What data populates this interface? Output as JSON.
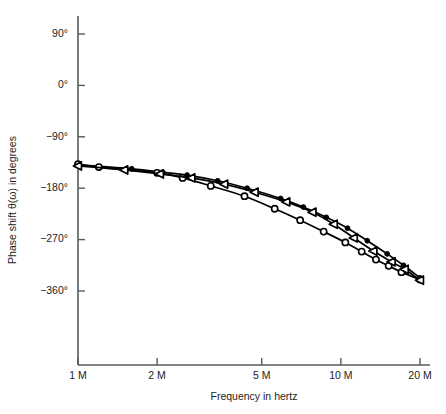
{
  "chart_data": {
    "type": "line",
    "title": "",
    "xlabel": "Frequency in hertz",
    "ylabel": "Phase shift θ(ω) in degrees",
    "xscale": "log",
    "xlim": [
      1000000,
      20000000
    ],
    "ylim": [
      -400,
      120
    ],
    "grid": false,
    "legend": "none",
    "xticks": [
      {
        "value": 1000000,
        "label": "1 M"
      },
      {
        "value": 2000000,
        "label": "2 M"
      },
      {
        "value": 5000000,
        "label": "5 M"
      },
      {
        "value": 10000000,
        "label": "10 M"
      },
      {
        "value": 20000000,
        "label": "20 M"
      }
    ],
    "yticks": [
      {
        "value": 90,
        "label": "90°"
      },
      {
        "value": 0,
        "label": "0°"
      },
      {
        "value": -90,
        "label": "−90°"
      },
      {
        "value": -180,
        "label": "−180°"
      },
      {
        "value": -270,
        "label": "−270°"
      },
      {
        "value": -360,
        "label": "−360°"
      }
    ],
    "series": [
      {
        "name": "filled-dot-curve",
        "marker": "filled-circle",
        "x": [
          1000000,
          1600000,
          2100000,
          2600000,
          3400000,
          4400000,
          5900000,
          7200000,
          8800000,
          10600000,
          12600000,
          15000000,
          17300000,
          20000000
        ],
        "y": [
          -139,
          -146,
          -152,
          -157,
          -167,
          -180,
          -198,
          -213,
          -231,
          -250,
          -272,
          -295,
          -315,
          -337
        ]
      },
      {
        "name": "open-circle-curve",
        "marker": "open-circle",
        "x": [
          1000000,
          1200000,
          2000000,
          2500000,
          3200000,
          4300000,
          5600000,
          7000000,
          8600000,
          10400000,
          12000000,
          13600000,
          15200000,
          17000000,
          20000000
        ],
        "y": [
          -138,
          -143,
          -153,
          -162,
          -176,
          -194,
          -216,
          -236,
          -256,
          -275,
          -291,
          -305,
          -316,
          -327,
          -340
        ]
      },
      {
        "name": "open-triangle-curve",
        "marker": "open-triangle",
        "x": [
          1000000,
          1500000,
          2050000,
          2700000,
          3600000,
          4700000,
          6200000,
          7800000,
          9400000,
          11200000,
          13300000,
          15600000,
          17500000,
          20000000
        ],
        "y": [
          -141,
          -148,
          -155,
          -162,
          -173,
          -187,
          -204,
          -222,
          -243,
          -267,
          -290,
          -309,
          -322,
          -341
        ]
      }
    ]
  },
  "axes": {
    "x_title": "Frequency in hertz",
    "y_title": "Phase shift θ(ω) in degrees"
  },
  "colors": {
    "axis": "#555c5e",
    "curve": "#000000",
    "background": "#ffffff",
    "text": "#1d1d1d"
  }
}
